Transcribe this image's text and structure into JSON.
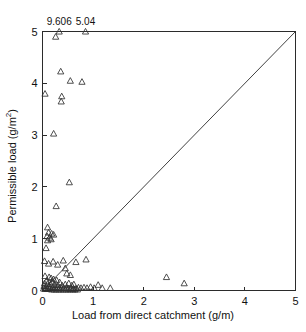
{
  "chart_data": {
    "type": "scatter",
    "title": "",
    "xlabel": "Load from direct catchment (g/m)",
    "ylabel": "Permissible load (g/m²)",
    "ylabel_base": "Permissible load (g/m",
    "ylabel_sup": "2",
    "ylabel_close": ")",
    "xlim": [
      0,
      5
    ],
    "ylim": [
      0,
      5
    ],
    "xticks": [
      0,
      1,
      2,
      3,
      4,
      5
    ],
    "yticks": [
      0,
      1,
      2,
      3,
      4,
      5
    ],
    "xtick_labels": [
      "0",
      "1",
      "2",
      "3",
      "4",
      "5"
    ],
    "ytick_labels": [
      "0",
      "1",
      "2",
      "3",
      "4",
      "5"
    ],
    "grid": false,
    "legend": false,
    "marker": "open-triangle-up",
    "marker_color": "#303030",
    "reference_line": {
      "name": "1:1 line",
      "from": [
        0,
        0
      ],
      "to": [
        5,
        5
      ]
    },
    "annotations": [
      {
        "text": "9.606",
        "x": 0.33,
        "y": 5.0,
        "note": "off-scale point value"
      },
      {
        "text": "5.04",
        "x": 0.85,
        "y": 5.0,
        "note": "off-scale point value"
      }
    ],
    "points": [
      [
        0.33,
        5.0
      ],
      [
        0.85,
        5.0
      ],
      [
        0.26,
        4.9
      ],
      [
        0.36,
        4.23
      ],
      [
        0.55,
        4.05
      ],
      [
        0.78,
        4.03
      ],
      [
        0.05,
        3.8
      ],
      [
        0.38,
        3.75
      ],
      [
        0.37,
        3.65
      ],
      [
        0.22,
        3.03
      ],
      [
        0.53,
        2.09
      ],
      [
        0.27,
        1.63
      ],
      [
        0.1,
        1.22
      ],
      [
        0.12,
        1.12
      ],
      [
        0.18,
        1.1
      ],
      [
        0.22,
        1.08
      ],
      [
        0.09,
        1.05
      ],
      [
        0.14,
        1.02
      ],
      [
        0.17,
        0.99
      ],
      [
        0.1,
        0.97
      ],
      [
        0.07,
        0.82
      ],
      [
        0.04,
        0.57
      ],
      [
        0.21,
        0.56
      ],
      [
        0.41,
        0.58
      ],
      [
        0.66,
        0.55
      ],
      [
        0.86,
        0.6
      ],
      [
        0.12,
        0.52
      ],
      [
        0.3,
        0.5
      ],
      [
        0.45,
        0.43
      ],
      [
        0.48,
        0.33
      ],
      [
        0.55,
        0.3
      ],
      [
        0.05,
        0.28
      ],
      [
        0.13,
        0.26
      ],
      [
        0.17,
        0.24
      ],
      [
        0.22,
        0.22
      ],
      [
        0.28,
        0.2
      ],
      [
        0.08,
        0.19
      ],
      [
        0.19,
        0.17
      ],
      [
        0.34,
        0.16
      ],
      [
        0.52,
        0.14
      ],
      [
        0.04,
        0.14
      ],
      [
        0.1,
        0.13
      ],
      [
        0.16,
        0.12
      ],
      [
        0.24,
        0.11
      ],
      [
        0.3,
        0.1
      ],
      [
        0.39,
        0.1
      ],
      [
        0.45,
        0.12
      ],
      [
        0.58,
        0.1
      ],
      [
        0.62,
        0.12
      ],
      [
        0.03,
        0.09
      ],
      [
        0.07,
        0.08
      ],
      [
        0.12,
        0.08
      ],
      [
        0.15,
        0.07
      ],
      [
        0.2,
        0.07
      ],
      [
        0.25,
        0.06
      ],
      [
        0.29,
        0.06
      ],
      [
        0.33,
        0.05
      ],
      [
        0.37,
        0.05
      ],
      [
        0.42,
        0.05
      ],
      [
        0.47,
        0.05
      ],
      [
        0.51,
        0.04
      ],
      [
        0.56,
        0.04
      ],
      [
        0.61,
        0.04
      ],
      [
        0.66,
        0.04
      ],
      [
        0.71,
        0.06
      ],
      [
        0.76,
        0.05
      ],
      [
        0.82,
        0.06
      ],
      [
        0.88,
        0.05
      ],
      [
        0.95,
        0.07
      ],
      [
        1.02,
        0.05
      ],
      [
        1.1,
        0.11
      ],
      [
        1.18,
        0.05
      ],
      [
        1.34,
        0.05
      ],
      [
        0.02,
        0.04
      ],
      [
        0.05,
        0.03
      ],
      [
        0.09,
        0.03
      ],
      [
        0.13,
        0.03
      ],
      [
        0.18,
        0.02
      ],
      [
        0.23,
        0.02
      ],
      [
        0.27,
        0.02
      ],
      [
        0.32,
        0.02
      ],
      [
        0.36,
        0.02
      ],
      [
        0.41,
        0.02
      ],
      [
        0.46,
        0.02
      ],
      [
        0.5,
        0.02
      ],
      [
        0.55,
        0.02
      ],
      [
        0.6,
        0.02
      ],
      [
        0.64,
        0.02
      ],
      [
        0.69,
        0.02
      ],
      [
        2.45,
        0.26
      ],
      [
        2.8,
        0.14
      ]
    ]
  }
}
